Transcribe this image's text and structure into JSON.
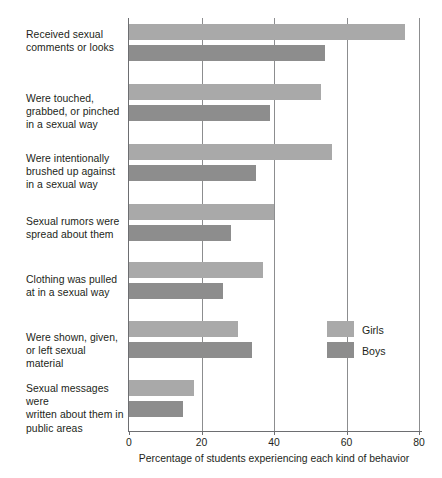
{
  "chart_data": {
    "type": "bar",
    "orientation": "horizontal",
    "title": "",
    "xlabel": "Percentage of students experiencing each kind of behavior",
    "ylabel": "",
    "xlim": [
      0,
      80
    ],
    "xticks": [
      0,
      20,
      40,
      60,
      80
    ],
    "xtick_labels": [
      "0",
      "20",
      "40",
      "60",
      "80"
    ],
    "grid": "vertical",
    "legend_position": "middle-right",
    "categories": [
      "Received sexual comments or looks",
      "Were touched, grabbed, or pinched in a sexual way",
      "Were intentionally brushed up against in a sexual way",
      "Sexual rumors were spread about them",
      "Clothing was pulled at in a sexual way",
      "Were shown, given, or left sexual material",
      "Sexual messages were written about them in public areas"
    ],
    "category_lines": [
      [
        "Received sexual",
        "comments or looks"
      ],
      [
        "Were touched,",
        "grabbed, or pinched",
        "in a sexual way"
      ],
      [
        "Were intentionally",
        "brushed up against",
        "in a sexual way"
      ],
      [
        "Sexual rumors were",
        "spread about them"
      ],
      [
        "Clothing was pulled",
        "at in a sexual way"
      ],
      [
        "Were shown, given,",
        "or left sexual material"
      ],
      [
        "Sexual messages were",
        "written about them in",
        "public areas"
      ]
    ],
    "series": [
      {
        "name": "Girls",
        "color": "#a9a9a9",
        "values": [
          76,
          53,
          56,
          40,
          37,
          30,
          18
        ]
      },
      {
        "name": "Boys",
        "color": "#8d8d8d",
        "values": [
          54,
          39,
          35,
          28,
          26,
          34,
          15
        ]
      }
    ]
  },
  "legend": {
    "items": [
      {
        "label": "Girls",
        "color": "#a9a9a9"
      },
      {
        "label": "Boys",
        "color": "#8d8d8d"
      }
    ]
  },
  "colors": {
    "girls": "#a9a9a9",
    "boys": "#8d8d8d",
    "axis": "#6d6e71",
    "grid": "#8c8d8f",
    "text": "#231f20",
    "background": "#ffffff"
  }
}
